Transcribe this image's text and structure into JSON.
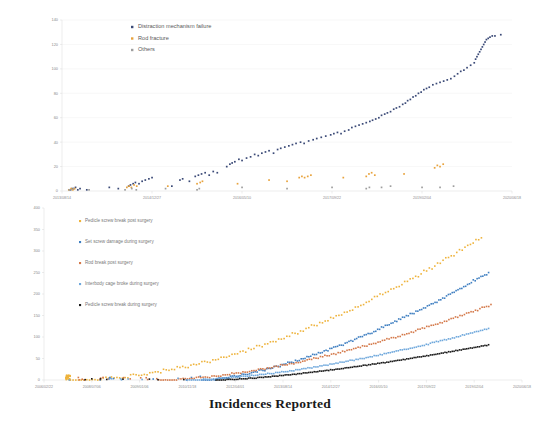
{
  "figure": {
    "title": "Incidences Reported"
  },
  "chart_data": [
    {
      "id": "top",
      "type": "scatter",
      "title": "",
      "xlabel": "",
      "ylabel": "",
      "ylim": [
        0,
        140
      ],
      "yticks": [
        0,
        20,
        40,
        60,
        80,
        100,
        120,
        140
      ],
      "xticks": [
        "2013/08/14",
        "2014/12/27",
        "2016/05/10",
        "2017/09/22",
        "2019/02/04",
        "2020/06/18"
      ],
      "grid": true,
      "legend_position": "top-center",
      "series": [
        {
          "name": "Distraction mechanism failure",
          "color": "#3b4a77",
          "points": [
            [
              0.018,
              1
            ],
            [
              0.022,
              2
            ],
            [
              0.026,
              2
            ],
            [
              0.03,
              3
            ],
            [
              0.035,
              1
            ],
            [
              0.04,
              2
            ],
            [
              0.055,
              1
            ],
            [
              0.105,
              3
            ],
            [
              0.125,
              2
            ],
            [
              0.148,
              4
            ],
            [
              0.152,
              5
            ],
            [
              0.158,
              6
            ],
            [
              0.163,
              7
            ],
            [
              0.171,
              6
            ],
            [
              0.178,
              8
            ],
            [
              0.185,
              9
            ],
            [
              0.193,
              10
            ],
            [
              0.2,
              11
            ],
            [
              0.244,
              4
            ],
            [
              0.262,
              9
            ],
            [
              0.268,
              10
            ],
            [
              0.283,
              8
            ],
            [
              0.296,
              12
            ],
            [
              0.303,
              13
            ],
            [
              0.31,
              14
            ],
            [
              0.318,
              15
            ],
            [
              0.327,
              13
            ],
            [
              0.336,
              16
            ],
            [
              0.345,
              15
            ],
            [
              0.366,
              20
            ],
            [
              0.373,
              22
            ],
            [
              0.378,
              23
            ],
            [
              0.384,
              24
            ],
            [
              0.393,
              26
            ],
            [
              0.4,
              25
            ],
            [
              0.41,
              27
            ],
            [
              0.419,
              28
            ],
            [
              0.428,
              30
            ],
            [
              0.436,
              29
            ],
            [
              0.444,
              31
            ],
            [
              0.452,
              32
            ],
            [
              0.46,
              33
            ],
            [
              0.47,
              31
            ],
            [
              0.479,
              34
            ],
            [
              0.486,
              35
            ],
            [
              0.495,
              36
            ],
            [
              0.504,
              37
            ],
            [
              0.512,
              38
            ],
            [
              0.52,
              39
            ],
            [
              0.53,
              40
            ],
            [
              0.538,
              39
            ],
            [
              0.548,
              41
            ],
            [
              0.558,
              42
            ],
            [
              0.566,
              43
            ],
            [
              0.576,
              44
            ],
            [
              0.586,
              45
            ],
            [
              0.597,
              46
            ],
            [
              0.604,
              47
            ],
            [
              0.612,
              48
            ],
            [
              0.62,
              47
            ],
            [
              0.628,
              49
            ],
            [
              0.637,
              50
            ],
            [
              0.644,
              52
            ],
            [
              0.652,
              53
            ],
            [
              0.66,
              54
            ],
            [
              0.668,
              55
            ],
            [
              0.676,
              56
            ],
            [
              0.684,
              57
            ],
            [
              0.69,
              58
            ],
            [
              0.697,
              59
            ],
            [
              0.704,
              60
            ],
            [
              0.71,
              62
            ],
            [
              0.717,
              63
            ],
            [
              0.723,
              64
            ],
            [
              0.73,
              65
            ],
            [
              0.737,
              67
            ],
            [
              0.743,
              68
            ],
            [
              0.75,
              69
            ],
            [
              0.757,
              71
            ],
            [
              0.763,
              72
            ],
            [
              0.768,
              74
            ],
            [
              0.774,
              75
            ],
            [
              0.78,
              77
            ],
            [
              0.786,
              78
            ],
            [
              0.792,
              80
            ],
            [
              0.798,
              81
            ],
            [
              0.804,
              83
            ],
            [
              0.81,
              84
            ],
            [
              0.816,
              85
            ],
            [
              0.824,
              87
            ],
            [
              0.832,
              88
            ],
            [
              0.84,
              89
            ],
            [
              0.848,
              90
            ],
            [
              0.856,
              91
            ],
            [
              0.864,
              92
            ],
            [
              0.872,
              94
            ],
            [
              0.879,
              96
            ],
            [
              0.886,
              98
            ],
            [
              0.893,
              99
            ],
            [
              0.9,
              101
            ],
            [
              0.908,
              103
            ],
            [
              0.916,
              105
            ],
            [
              0.919,
              108
            ],
            [
              0.922,
              110
            ],
            [
              0.925,
              112
            ],
            [
              0.928,
              114
            ],
            [
              0.931,
              116
            ],
            [
              0.934,
              118
            ],
            [
              0.937,
              120
            ],
            [
              0.94,
              122
            ],
            [
              0.943,
              124
            ],
            [
              0.947,
              125
            ],
            [
              0.951,
              126
            ],
            [
              0.956,
              127
            ],
            [
              0.962,
              127
            ],
            [
              0.975,
              128
            ]
          ]
        },
        {
          "name": "Rod fracture",
          "color": "#e8a33d",
          "points": [
            [
              0.015,
              1
            ],
            [
              0.02,
              2
            ],
            [
              0.024,
              1
            ],
            [
              0.028,
              2
            ],
            [
              0.144,
              3
            ],
            [
              0.149,
              4
            ],
            [
              0.154,
              3
            ],
            [
              0.16,
              5
            ],
            [
              0.166,
              4
            ],
            [
              0.235,
              4
            ],
            [
              0.3,
              6
            ],
            [
              0.307,
              7
            ],
            [
              0.312,
              8
            ],
            [
              0.39,
              6
            ],
            [
              0.46,
              9
            ],
            [
              0.5,
              8
            ],
            [
              0.527,
              11
            ],
            [
              0.533,
              12
            ],
            [
              0.539,
              11
            ],
            [
              0.546,
              12
            ],
            [
              0.553,
              13
            ],
            [
              0.625,
              11
            ],
            [
              0.676,
              12
            ],
            [
              0.682,
              14
            ],
            [
              0.688,
              15
            ],
            [
              0.695,
              13
            ],
            [
              0.76,
              14
            ],
            [
              0.828,
              19
            ],
            [
              0.834,
              21
            ],
            [
              0.84,
              20
            ],
            [
              0.847,
              22
            ]
          ]
        },
        {
          "name": "Others",
          "color": "#9e9e9e",
          "points": [
            [
              0.016,
              1
            ],
            [
              0.02,
              1
            ],
            [
              0.025,
              2
            ],
            [
              0.06,
              1
            ],
            [
              0.14,
              1
            ],
            [
              0.155,
              2
            ],
            [
              0.165,
              1
            ],
            [
              0.23,
              2
            ],
            [
              0.3,
              1
            ],
            [
              0.305,
              2
            ],
            [
              0.4,
              3
            ],
            [
              0.5,
              2
            ],
            [
              0.6,
              3
            ],
            [
              0.676,
              2
            ],
            [
              0.683,
              3
            ],
            [
              0.71,
              3
            ],
            [
              0.73,
              4
            ],
            [
              0.8,
              3
            ],
            [
              0.84,
              3
            ],
            [
              0.87,
              4
            ]
          ]
        }
      ]
    },
    {
      "id": "bottom",
      "type": "line",
      "title": "",
      "xlabel": "",
      "ylabel": "",
      "ylim": [
        0,
        400
      ],
      "yticks": [
        0,
        50,
        100,
        150,
        200,
        250,
        300,
        350,
        400
      ],
      "xticks": [
        "2006/02/22",
        "2008/07/06",
        "2009/01/06",
        "2010/11/18",
        "2012/04/01",
        "2013/08/14",
        "2014/12/27",
        "2016/05/10",
        "2017/09/22",
        "2019/02/04",
        "2020/06/18"
      ],
      "grid": false,
      "legend_position": "left",
      "series": [
        {
          "name": "Pedicle screw break post surgery",
          "color": "#eeb33c",
          "end_value": 332
        },
        {
          "name": "Set screw damage during surgery",
          "color": "#3f7fc1",
          "end_value": 250
        },
        {
          "name": "Rod break post surgery",
          "color": "#d4794a",
          "end_value": 175
        },
        {
          "name": "Interbody cage broke during surgery",
          "color": "#6fa8dc",
          "end_value": 120
        },
        {
          "name": "Pedicle screw break during surgery",
          "color": "#1a1a1a",
          "end_value": 82
        }
      ]
    }
  ]
}
